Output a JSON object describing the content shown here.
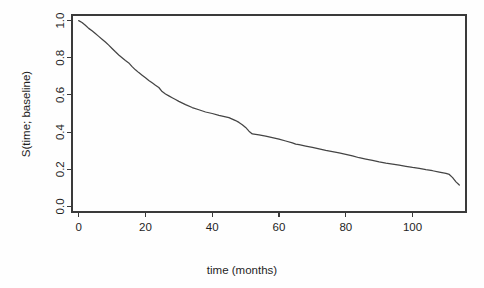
{
  "figure": {
    "background_color": "#fefefe",
    "line_color": "#444444",
    "axis_color": "#3a3a3a",
    "text_color": "#1f1f1f"
  },
  "axes": {
    "x_title": "time (months)",
    "y_title": "S(time; baseline)",
    "x_ticks": [
      "0",
      "20",
      "40",
      "60",
      "80",
      "100"
    ],
    "y_ticks": [
      "0.0",
      "0.2",
      "0.4",
      "0.6",
      "0.8",
      "1.0"
    ]
  },
  "chart_data": {
    "type": "line",
    "title": "",
    "subtitle": "",
    "xlabel": "time (months)",
    "ylabel": "S(time; baseline)",
    "xlim": [
      -2,
      116
    ],
    "ylim": [
      -0.03,
      1.03
    ],
    "xticks": [
      0,
      20,
      40,
      60,
      80,
      100
    ],
    "yticks": [
      0.0,
      0.2,
      0.4,
      0.6,
      0.8,
      1.0
    ],
    "grid": false,
    "legend": null,
    "legend_position": "none",
    "annotations": [],
    "series": [
      {
        "name": "baseline survival",
        "x": [
          0,
          1,
          2,
          3,
          4,
          5,
          6,
          7,
          8,
          9,
          10,
          11,
          12,
          13,
          14,
          15,
          16,
          17,
          18,
          19,
          20,
          21,
          22,
          23,
          24,
          25,
          26,
          27,
          28,
          29,
          30,
          32,
          34,
          36,
          38,
          40,
          42,
          44,
          45,
          46,
          47,
          48,
          49,
          50,
          51,
          52,
          54,
          56,
          58,
          60,
          62,
          64,
          65,
          66,
          68,
          70,
          72,
          74,
          76,
          78,
          80,
          82,
          84,
          86,
          88,
          90,
          92,
          94,
          96,
          98,
          100,
          102,
          104,
          106,
          108,
          110,
          111,
          112,
          113,
          114
        ],
        "y": [
          1.0,
          0.99,
          0.975,
          0.958,
          0.945,
          0.93,
          0.915,
          0.9,
          0.885,
          0.868,
          0.85,
          0.832,
          0.815,
          0.8,
          0.785,
          0.772,
          0.752,
          0.735,
          0.72,
          0.706,
          0.692,
          0.678,
          0.665,
          0.652,
          0.64,
          0.618,
          0.605,
          0.595,
          0.585,
          0.575,
          0.565,
          0.548,
          0.532,
          0.52,
          0.508,
          0.5,
          0.49,
          0.482,
          0.478,
          0.47,
          0.462,
          0.452,
          0.44,
          0.425,
          0.405,
          0.39,
          0.385,
          0.378,
          0.37,
          0.362,
          0.352,
          0.342,
          0.335,
          0.332,
          0.325,
          0.318,
          0.31,
          0.302,
          0.295,
          0.288,
          0.28,
          0.272,
          0.262,
          0.255,
          0.248,
          0.24,
          0.233,
          0.228,
          0.222,
          0.216,
          0.21,
          0.205,
          0.198,
          0.192,
          0.185,
          0.178,
          0.172,
          0.155,
          0.132,
          0.115
        ]
      }
    ]
  }
}
